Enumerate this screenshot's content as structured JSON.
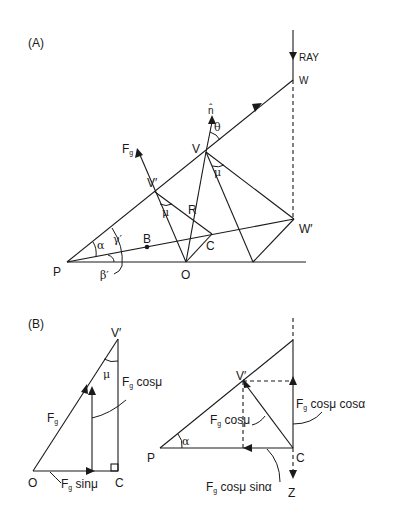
{
  "diagram_a": {
    "panel_label": "(A)",
    "labels": {
      "ray": "RAY",
      "W": "W",
      "W_prime": "W′",
      "V": "V",
      "V_prime": "V′",
      "n_hat": "n̂",
      "theta": "θ",
      "Fg": "F",
      "Fg_sub": "g",
      "R": "R",
      "mu_at_V": "μ",
      "mu_at_V_prime": "μ",
      "alpha": "α",
      "gamma_prime": "γ′",
      "beta_prime": "β′",
      "B": "B",
      "C": "C",
      "P": "P",
      "O": "O"
    }
  },
  "diagram_b": {
    "panel_label": "(B)",
    "left": {
      "V_prime": "V′",
      "mu": "μ",
      "Fg": "F",
      "Fg_sub": "g",
      "Fg_cos_mu": " cosμ",
      "Fg_sin_mu": " sinμ",
      "O": "O",
      "C": "C"
    },
    "right": {
      "V_prime": "V′",
      "alpha": "α",
      "P": "P",
      "C": "C",
      "Z": "Z",
      "Fg": "F",
      "Fg_sub": "g",
      "Fg_cos_mu": " cosμ",
      "Fg_cos_mu_cos_alpha": " cosμ cosα",
      "Fg_cos_mu_sin_alpha": " cosμ sinα"
    }
  },
  "colors": {
    "ink": "#1a1a1a",
    "background": "#ffffff"
  }
}
